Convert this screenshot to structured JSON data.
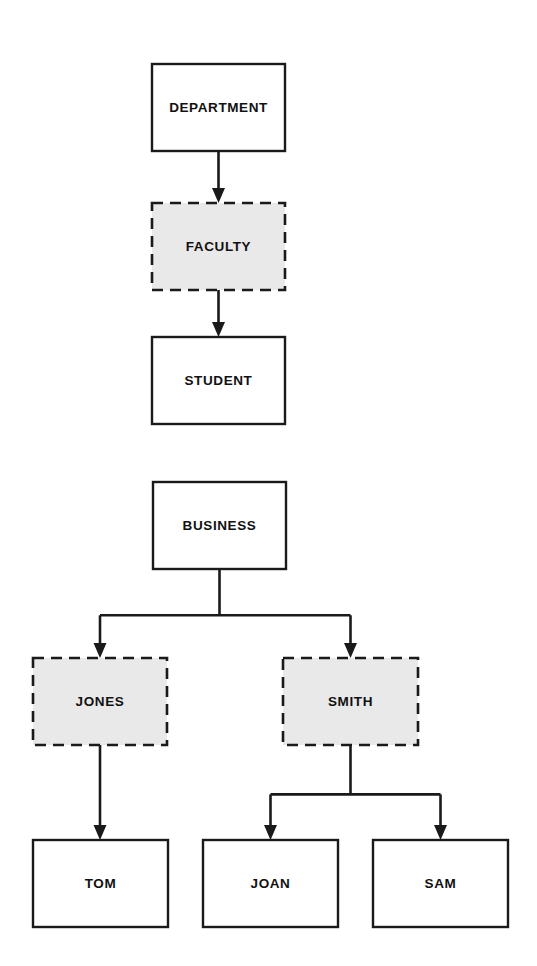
{
  "diagram": {
    "type": "tree-hierarchy",
    "background_color": "#ffffff",
    "line_color": "#1a1a1a",
    "solid_box_fill": "#ffffff",
    "dashed_box_fill": "#e9e9e9",
    "label_color": "#111111"
  },
  "groups": [
    {
      "id": "group-academic",
      "name": "Academic hierarchy",
      "nodes": [
        {
          "id": "department",
          "label": "DEPARTMENT",
          "style": "solid",
          "x": 152,
          "y": 64,
          "width": 133,
          "height": 87
        },
        {
          "id": "faculty",
          "label": "FACULTY",
          "style": "dashed",
          "x": 152,
          "y": 203,
          "width": 133,
          "height": 87
        },
        {
          "id": "student",
          "label": "STUDENT",
          "style": "solid",
          "x": 152,
          "y": 337,
          "width": 133,
          "height": 87
        }
      ],
      "edges": [
        {
          "id": "edge-department-faculty",
          "from": "department",
          "to": "faculty",
          "kind": "straight"
        },
        {
          "id": "edge-faculty-student",
          "from": "faculty",
          "to": "student",
          "kind": "straight"
        }
      ]
    },
    {
      "id": "group-business",
      "name": "Business hierarchy",
      "nodes": [
        {
          "id": "business",
          "label": "BUSINESS",
          "style": "solid",
          "x": 153,
          "y": 482,
          "width": 133,
          "height": 87
        },
        {
          "id": "jones",
          "label": "JONES",
          "style": "dashed",
          "x": 33,
          "y": 658,
          "width": 134,
          "height": 87
        },
        {
          "id": "smith",
          "label": "SMITH",
          "style": "dashed",
          "x": 283,
          "y": 658,
          "width": 135,
          "height": 87
        },
        {
          "id": "tom",
          "label": "TOM",
          "style": "solid",
          "x": 33,
          "y": 840,
          "width": 135,
          "height": 87
        },
        {
          "id": "joan",
          "label": "JOAN",
          "style": "solid",
          "x": 203,
          "y": 840,
          "width": 135,
          "height": 87
        },
        {
          "id": "sam",
          "label": "SAM",
          "style": "solid",
          "x": 373,
          "y": 840,
          "width": 135,
          "height": 87
        }
      ],
      "edges": [
        {
          "id": "edge-business-jones",
          "from": "business",
          "to": "jones",
          "kind": "branch"
        },
        {
          "id": "edge-business-smith",
          "from": "business",
          "to": "smith",
          "kind": "branch"
        },
        {
          "id": "edge-jones-tom",
          "from": "jones",
          "to": "tom",
          "kind": "straight"
        },
        {
          "id": "edge-smith-joan",
          "from": "smith",
          "to": "joan",
          "kind": "branch"
        },
        {
          "id": "edge-smith-sam",
          "from": "smith",
          "to": "sam",
          "kind": "branch"
        }
      ]
    }
  ]
}
